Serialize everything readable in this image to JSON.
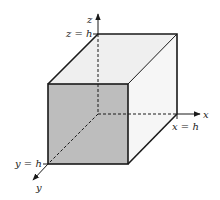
{
  "diagram": {
    "type": "cube-in-3d-axes",
    "labels": {
      "z_axis": "z",
      "x_axis": "x",
      "y_axis": "y",
      "z_top": "z = h",
      "x_end": "x = h",
      "y_end": "y = h"
    },
    "colors": {
      "front_face": "#bdbdbd",
      "top_face": "#efefef",
      "side_face": "#f7f7f7",
      "edge": "#1a1a1a"
    }
  }
}
